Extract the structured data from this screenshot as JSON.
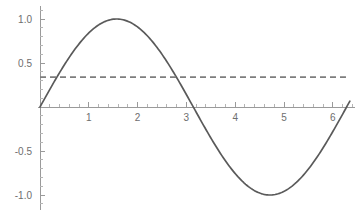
{
  "chart_data": {
    "type": "line",
    "title": "",
    "subtitle": "",
    "xlabel": "",
    "ylabel": "",
    "xlim": [
      -0.05,
      6.45
    ],
    "ylim": [
      -1.12,
      1.12
    ],
    "grid": false,
    "legend": null,
    "x_ticks": [
      1,
      2,
      3,
      4,
      5,
      6
    ],
    "x_tick_labels": [
      "1",
      "2",
      "3",
      "4",
      "5",
      "6"
    ],
    "x_minor_tick_step": 0.2,
    "y_ticks": [
      1.0,
      0.5,
      -0.5,
      -1.0
    ],
    "y_tick_labels": [
      "1.0",
      "0.5",
      "-0.5",
      "-1.0"
    ],
    "y_minor_tick_step": 0.1,
    "axis_color": "#9a9a9a",
    "tick_label_color": "#6e6e6e",
    "background_color": "#ffffff",
    "series": [
      {
        "name": "sin(x)",
        "style": "solid",
        "color": "#5a5a5a",
        "x_start": 0,
        "x_end": 6.35,
        "samples": 220,
        "function": "sin",
        "amplitude": 1.0,
        "points_note": "sine wave: zero at 0, peak 1.0 at 1.571, zero at 3.142, trough -1.0 at 4.712, zero at 6.283",
        "key_points": [
          {
            "x": 0.0,
            "y": 0.0
          },
          {
            "x": 1.571,
            "y": 1.0
          },
          {
            "x": 3.142,
            "y": 0.0
          },
          {
            "x": 4.712,
            "y": -1.0
          },
          {
            "x": 6.283,
            "y": 0.0
          },
          {
            "x": 6.35,
            "y": 0.067
          }
        ]
      },
      {
        "name": "constant",
        "style": "dashed",
        "color": "#7d7d7d",
        "constant_value": 0.34,
        "x_start": 0.0,
        "x_end": 6.27
      }
    ]
  }
}
